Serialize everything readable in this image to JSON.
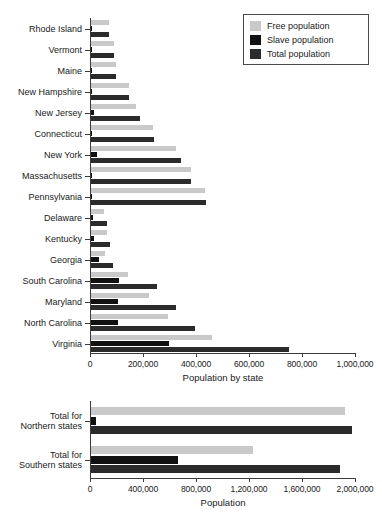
{
  "figure": {
    "background": "#ffffff",
    "width": 382,
    "height": 521
  },
  "legend": {
    "position": "top-right",
    "entries": [
      {
        "key": "free",
        "label": "Free population",
        "color": "#c9c9c9"
      },
      {
        "key": "slave",
        "label": "Slave population",
        "color": "#111111"
      },
      {
        "key": "total",
        "label": "Total population",
        "color": "#2b2b2b"
      }
    ]
  },
  "chart_data": [
    {
      "id": "by-state",
      "type": "bar",
      "orientation": "horizontal",
      "title": "",
      "xlabel": "Population by state",
      "ylabel": "",
      "xlim": [
        0,
        1000000
      ],
      "grid": false,
      "legend_position": "top-right",
      "xticks": [
        0,
        200000,
        400000,
        600000,
        800000,
        1000000
      ],
      "xtick_labels": [
        "0",
        "200,000",
        "400,000",
        "600,000",
        "800,000",
        "1,000,000"
      ],
      "categories": [
        "Rhode Island",
        "Vermont",
        "Maine",
        "New Hampshire",
        "New Jersey",
        "Connecticut",
        "New York",
        "Massachusetts",
        "Pennsylvania",
        "Delaware",
        "Kentucky",
        "Georgia",
        "South Carolina",
        "Maryland",
        "North Carolina",
        "Virginia"
      ],
      "series": [
        {
          "name": "Free population",
          "color": "#c9c9c9",
          "values": [
            68000,
            85000,
            96000,
            142000,
            169000,
            233000,
            319000,
            378000,
            430000,
            50000,
            61000,
            53000,
            141000,
            217000,
            289000,
            455000
          ]
        },
        {
          "name": "Slave population",
          "color": "#111111",
          "values": [
            958,
            16,
            0,
            158,
            11423,
            2764,
            21324,
            0,
            3737,
            8887,
            12430,
            29264,
            107094,
            103036,
            100572,
            292627
          ]
        },
        {
          "name": "Total population",
          "color": "#2b2b2b",
          "values": [
            69000,
            85000,
            96000,
            142000,
            184000,
            238000,
            340000,
            378000,
            434000,
            59000,
            73000,
            82000,
            249000,
            320000,
            394000,
            748000
          ]
        }
      ]
    },
    {
      "id": "regional-totals",
      "type": "bar",
      "orientation": "horizontal",
      "title": "",
      "xlabel": "Population",
      "ylabel": "",
      "xlim": [
        0,
        2000000
      ],
      "grid": false,
      "xticks": [
        0,
        400000,
        800000,
        1200000,
        1600000,
        2000000
      ],
      "xtick_labels": [
        "0",
        "400,000",
        "800,000",
        "1,200,000",
        "1,600,000",
        "2,000,000"
      ],
      "categories": [
        "Total for\nNorthern states",
        "Total for\nSouthern states"
      ],
      "category_lines": [
        [
          "Total for",
          "Northern states"
        ],
        [
          "Total for",
          "Southern states"
        ]
      ],
      "series": [
        {
          "name": "Free population",
          "color": "#c9c9c9",
          "values": [
            1920000,
            1223000
          ]
        },
        {
          "name": "Slave population",
          "color": "#111111",
          "values": [
            40370,
            654121
          ]
        },
        {
          "name": "Total population",
          "color": "#2b2b2b",
          "values": [
            1968000,
            1877000
          ]
        }
      ]
    }
  ]
}
